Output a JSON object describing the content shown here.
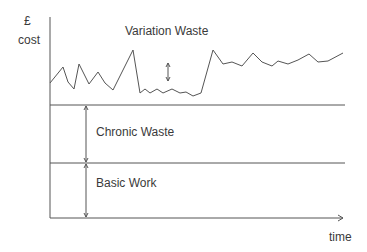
{
  "diagram": {
    "y_axis_label_symbol": "£",
    "y_axis_label": "cost",
    "x_axis_label": "time",
    "regions": [
      {
        "name": "variation",
        "label": "Variation Waste"
      },
      {
        "name": "chronic",
        "label": "Chronic Waste"
      },
      {
        "name": "basic",
        "label": "Basic Work"
      }
    ],
    "line_color": "#555555",
    "variation_curve": [
      [
        50,
        83
      ],
      [
        63,
        67
      ],
      [
        68,
        82
      ],
      [
        74,
        89
      ],
      [
        79,
        64
      ],
      [
        89,
        84
      ],
      [
        98,
        72
      ],
      [
        105,
        83
      ],
      [
        113,
        90
      ],
      [
        133,
        50
      ],
      [
        140,
        93
      ],
      [
        145,
        89
      ],
      [
        150,
        93
      ],
      [
        157,
        89
      ],
      [
        163,
        93
      ],
      [
        172,
        89
      ],
      [
        180,
        93
      ],
      [
        186,
        92
      ],
      [
        193,
        96
      ],
      [
        201,
        93
      ],
      [
        213,
        50
      ],
      [
        223,
        64
      ],
      [
        232,
        62
      ],
      [
        242,
        66
      ],
      [
        253,
        53
      ],
      [
        262,
        62
      ],
      [
        272,
        66
      ],
      [
        278,
        61
      ],
      [
        288,
        64
      ],
      [
        298,
        60
      ],
      [
        309,
        54
      ],
      [
        318,
        62
      ],
      [
        328,
        61
      ],
      [
        343,
        53
      ]
    ]
  }
}
